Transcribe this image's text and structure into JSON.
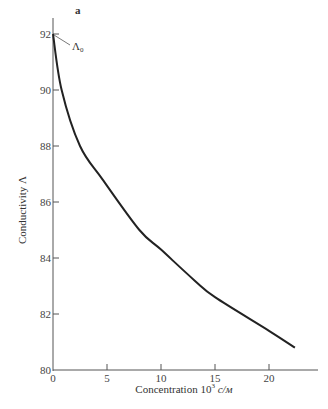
{
  "chart_data": {
    "type": "line",
    "panel_label": "a",
    "title": "",
    "xlabel": "Concentration 10³ c/м",
    "ylabel": "Conductivity Λ",
    "xlim": [
      0,
      24
    ],
    "ylim": [
      80,
      92.5
    ],
    "xticks": [
      0,
      5,
      10,
      15,
      20
    ],
    "yticks": [
      80,
      82,
      84,
      86,
      88,
      90,
      92
    ],
    "grid": false,
    "annotation": {
      "text": "Λ₀",
      "points_to": [
        0,
        92
      ]
    },
    "series": [
      {
        "name": "Conductivity",
        "x": [
          0,
          0.8,
          2.5,
          4.6,
          8.0,
          10.0,
          13.1,
          15.0,
          20.0,
          22.4
        ],
        "y": [
          92.0,
          90.0,
          88.0,
          86.8,
          85.0,
          84.3,
          83.2,
          82.6,
          81.4,
          80.8
        ]
      }
    ]
  },
  "labels": {
    "panel": "a",
    "annotation_main": "Λ",
    "annotation_sub": "0",
    "xlabel_text": "Concentration 10",
    "xlabel_sup": "3",
    "xlabel_unit": " c/м",
    "ylabel": "Conductivity Λ"
  }
}
